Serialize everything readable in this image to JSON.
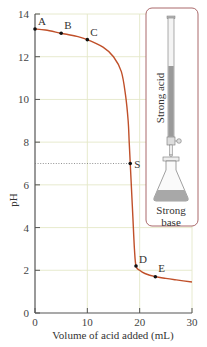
{
  "chart_data": {
    "type": "line",
    "title": "",
    "xlabel": "Volume of acid added (mL)",
    "ylabel": "pH",
    "xlim": [
      0,
      30
    ],
    "ylim": [
      0,
      14
    ],
    "x_ticks": [
      0,
      10,
      20,
      30
    ],
    "y_ticks": [
      0,
      2,
      4,
      6,
      8,
      10,
      12,
      14
    ],
    "grid": true,
    "series": [
      {
        "name": "Titration curve",
        "color": "#c0502a",
        "x": [
          0,
          2,
          5,
          8,
          10,
          13,
          15,
          16.5,
          17.3,
          17.8,
          18.0,
          18.2,
          18.4,
          18.7,
          19.0,
          19.3,
          20,
          21,
          23,
          25,
          27,
          30
        ],
        "y": [
          13.3,
          13.25,
          13.1,
          12.95,
          12.8,
          12.45,
          12.0,
          11.3,
          10.2,
          9.0,
          8.0,
          7.0,
          6.0,
          4.5,
          3.0,
          2.2,
          2.0,
          1.85,
          1.7,
          1.62,
          1.55,
          1.45
        ]
      }
    ],
    "points": [
      {
        "label": "A",
        "x": 0,
        "y": 13.3
      },
      {
        "label": "B",
        "x": 5,
        "y": 13.1
      },
      {
        "label": "C",
        "x": 10,
        "y": 12.8
      },
      {
        "label": "S",
        "x": 18.2,
        "y": 7.0
      },
      {
        "label": "D",
        "x": 19.3,
        "y": 2.2
      },
      {
        "label": "E",
        "x": 23,
        "y": 1.7
      }
    ],
    "annotations": [
      {
        "type": "dotted-hline",
        "y": 7,
        "x_from": 0,
        "x_to": 18.2
      }
    ],
    "inset": {
      "burette_label": "Strong acid",
      "flask_label_line1": "Strong",
      "flask_label_line2": "base"
    }
  }
}
